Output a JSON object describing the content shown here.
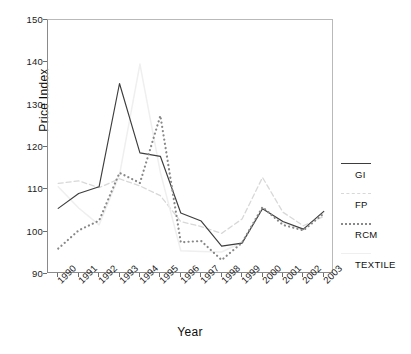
{
  "chart_data": {
    "type": "line",
    "title": "",
    "xlabel": "Year",
    "ylabel": "Price Index",
    "categories": [
      "1990",
      "1991",
      "1992",
      "1993",
      "1994",
      "1995",
      "1996",
      "1997",
      "1998",
      "1999",
      "2000",
      "2001",
      "2002",
      "2003"
    ],
    "ylim": [
      90,
      150
    ],
    "yticks": [
      90,
      100,
      110,
      120,
      130,
      140,
      150
    ],
    "grid": false,
    "legend_position": "right",
    "series": [
      {
        "name": "GI",
        "style": "solid",
        "color": "#3d3d3d",
        "values": [
          105.5,
          109.0,
          110.6,
          135.0,
          118.6,
          117.8,
          104.4,
          102.5,
          96.6,
          97.3,
          105.4,
          102.4,
          100.6,
          104.8
        ]
      },
      {
        "name": "FP",
        "style": "light-dashed",
        "color": "#d8d8d8",
        "values": [
          111.4,
          112.0,
          110.4,
          112.5,
          110.8,
          108.5,
          102.4,
          101.2,
          99.6,
          103.0,
          112.8,
          104.6,
          101.4,
          103.6
        ]
      },
      {
        "name": "RCM",
        "style": "dotted",
        "color": "#888888",
        "values": [
          96.0,
          100.3,
          102.6,
          113.9,
          111.5,
          127.4,
          97.5,
          97.8,
          93.3,
          97.4,
          105.8,
          101.6,
          100.3,
          104.3
        ]
      },
      {
        "name": "TEXTILE",
        "style": "light-solid",
        "color": "#efefef",
        "values": [
          110.6,
          105.6,
          101.6,
          113.4,
          139.6,
          114.0,
          95.5,
          95.3,
          95.2,
          97.5,
          105.6,
          102.2,
          100.4,
          104.6
        ]
      }
    ]
  },
  "legend": {
    "entries": [
      {
        "label": "GI",
        "swatch": "legend-line-solid"
      },
      {
        "label": "FP",
        "swatch": "legend-line-light-dashed"
      },
      {
        "label": "RCM",
        "swatch": "legend-line-dotted"
      },
      {
        "label": "TEXTILE",
        "swatch": "legend-line-light-solid"
      }
    ]
  }
}
